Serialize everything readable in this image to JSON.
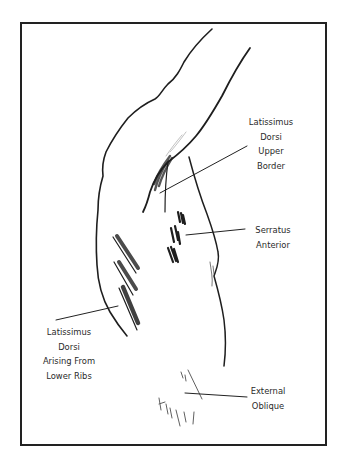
{
  "figure": {
    "type": "anatomical-sketch",
    "colors": {
      "ink": "#222222",
      "background": "#ffffff",
      "label_text": "#2a2a2a"
    },
    "labels": [
      {
        "id": "latissimus-dorsi-upper-border",
        "lines": [
          "Latissimus",
          "Dorsi",
          "Upper",
          "Border"
        ]
      },
      {
        "id": "serratus-anterior",
        "lines": [
          "Serratus",
          "Anterior"
        ]
      },
      {
        "id": "latissimus-dorsi-lower-ribs",
        "lines": [
          "Latissimus",
          "Dorsi",
          "Arising From",
          "Lower Ribs"
        ]
      },
      {
        "id": "external-oblique",
        "lines": [
          "External",
          "Oblique"
        ]
      }
    ]
  }
}
